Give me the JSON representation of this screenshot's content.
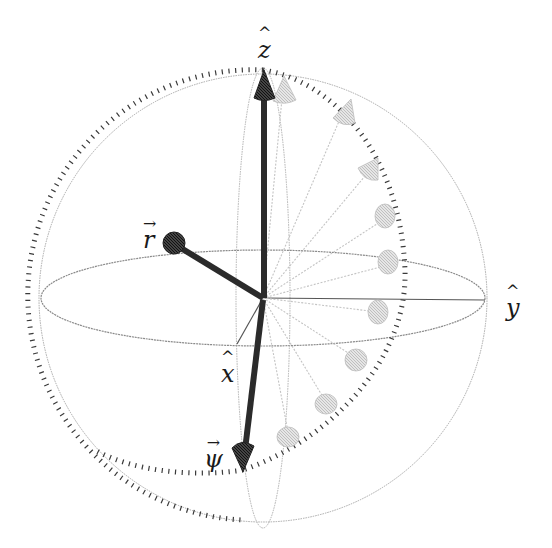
{
  "colors": {
    "background": "#ffffff",
    "vector_dark": "#2b2b2b",
    "ghost_vector": "#c8c8c8",
    "sphere_outline": "#9a9a9a",
    "ticks": "#3a3a3a",
    "axis": "#555555"
  },
  "axes": {
    "z": {
      "symbol": "z",
      "accent": "^",
      "label": "ẑ"
    },
    "y": {
      "symbol": "y",
      "accent": "^",
      "label": "ŷ"
    },
    "x": {
      "symbol": "x",
      "accent": "^",
      "label": "x̂"
    }
  },
  "vectors": {
    "r": {
      "symbol": "r",
      "accent": "→",
      "label": "r⃗",
      "icon": "sphere-head-arrow"
    },
    "psi": {
      "symbol": "ψ",
      "accent": "→",
      "label": "ψ⃗",
      "icon": "cone-head-arrow"
    },
    "z_vector": {
      "icon": "cone-head-arrow"
    }
  },
  "ghost_vector_count": 9,
  "geometry": {
    "center": [
      263,
      298
    ],
    "sphere_radius": 222,
    "equator_ry": 48,
    "meridian_rx": 27
  }
}
